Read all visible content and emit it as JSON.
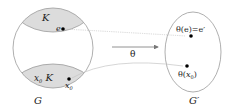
{
  "diagram": {
    "left_set": {
      "label": "G",
      "top_region": {
        "label": "K",
        "point_label": "e"
      },
      "bottom_region": {
        "label": "x₀K",
        "label_x": "x",
        "label_sub": "0",
        "label_rest": " K",
        "point_label_x": "x",
        "point_label_sub": "0"
      }
    },
    "right_set": {
      "label": "G′",
      "point_top_label": "θ(e)=e′",
      "point_bottom_label": "θ(x₀)",
      "point_bottom_prefix": "θ(",
      "point_bottom_x": "x",
      "point_bottom_sub": "0",
      "point_bottom_suffix": ")"
    },
    "map": {
      "label": "θ"
    },
    "colors": {
      "outline": "#9a9a9a",
      "region_fill": "#dcdcdc",
      "point": "#000000",
      "connector": "#bdbdbd",
      "arrow": "#777777"
    }
  }
}
